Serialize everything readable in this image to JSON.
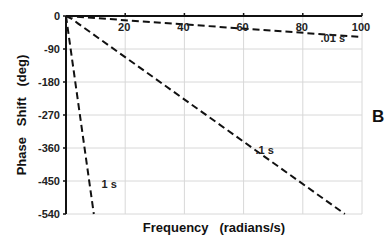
{
  "chart_data": {
    "type": "line",
    "title": "",
    "panel_label": "B",
    "xlabel": "Frequency   (radians/s)",
    "ylabel": "Phase   Shift   (deg)",
    "xlim": [
      0,
      100
    ],
    "ylim": [
      -540,
      0
    ],
    "xticks": [
      20,
      40,
      60,
      80,
      100
    ],
    "xtick_labels": [
      "20",
      "40",
      "60",
      "80",
      "100"
    ],
    "yticks": [
      0,
      -90,
      -180,
      -270,
      -360,
      -450,
      -540
    ],
    "ytick_labels": [
      "0",
      "-90",
      "-180",
      "-270",
      "-360",
      "-450",
      "-540"
    ],
    "grid": true,
    "line_style": "dashed",
    "series": [
      {
        "name": "1 s",
        "x": [
          0,
          9.4
        ],
        "y": [
          0,
          -540
        ]
      },
      {
        "name": ".1 s",
        "x": [
          0,
          2,
          4,
          94.2
        ],
        "y": [
          0,
          -8,
          -20,
          -540
        ]
      },
      {
        "name": ".01 s",
        "x": [
          0,
          100
        ],
        "y": [
          0,
          -57.3
        ]
      }
    ]
  }
}
